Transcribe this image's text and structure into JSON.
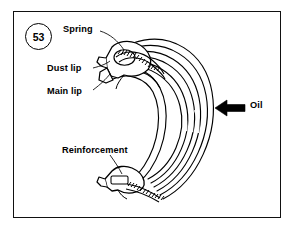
{
  "figure": {
    "number": "53",
    "background_color": "#ffffff",
    "line_color": "#000000",
    "border_color": "#111111"
  },
  "labels": {
    "spring": "Spring",
    "dust_lip": "Dust lip",
    "main_lip": "Main lip",
    "reinforcement": "Reinforcement",
    "oil": "Oil"
  },
  "callouts": [
    {
      "name": "spring-callout",
      "text": "Spring",
      "target": "garter-spring-in-upper-lip-section"
    },
    {
      "name": "dust-lip-callout",
      "text": "Dust lip",
      "target": "upper-seal-dust-lip"
    },
    {
      "name": "main-lip-callout",
      "text": "Main lip",
      "target": "upper-seal-main-sealing-lip"
    },
    {
      "name": "reinforcement-callout",
      "text": "Reinforcement",
      "target": "lower-metal-reinforcement-case"
    }
  ],
  "annotations": {
    "oil_arrow_direction": "left",
    "oil_arrow_color": "#000000",
    "oil_side_note": "Oil"
  }
}
